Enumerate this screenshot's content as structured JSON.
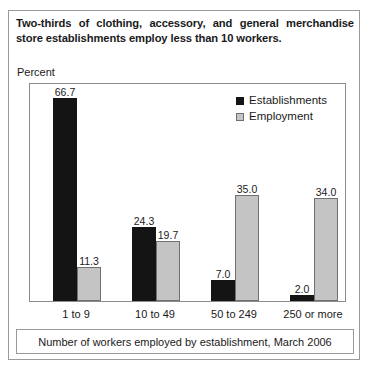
{
  "title": "Two-thirds of clothing, accessory, and general merchandise store establishments employ less than 10 workers.",
  "y_axis_label": "Percent",
  "footer_caption": "Number of workers employed by establishment, March 2006",
  "legend": {
    "items": [
      {
        "label": "Establishments",
        "color": "#141414",
        "swatch": "establishments-swatch"
      },
      {
        "label": "Employment",
        "color": "#c4c4c4",
        "swatch": "employment-swatch"
      }
    ]
  },
  "chart_data": {
    "type": "bar",
    "title": "Two-thirds of clothing, accessory, and general merchandise store establishments employ less than 10 workers.",
    "xlabel": "Number of workers employed by establishment, March 2006",
    "ylabel": "Percent",
    "categories": [
      "1 to 9",
      "10 to 49",
      "50 to 249",
      "250 or more"
    ],
    "series": [
      {
        "name": "Establishments",
        "color": "#141414",
        "values": [
          66.7,
          24.3,
          7.0,
          2.0
        ],
        "labels": [
          "66.7",
          "24.3",
          "7.0",
          "2.0"
        ]
      },
      {
        "name": "Employment",
        "color": "#c4c4c4",
        "values": [
          11.3,
          19.7,
          35.0,
          34.0
        ],
        "labels": [
          "11.3",
          "19.7",
          "35.0",
          "34.0"
        ]
      }
    ],
    "ylim": [
      0,
      72
    ],
    "grid": false,
    "legend_position": "top-right",
    "y_ticks_visible": false
  }
}
